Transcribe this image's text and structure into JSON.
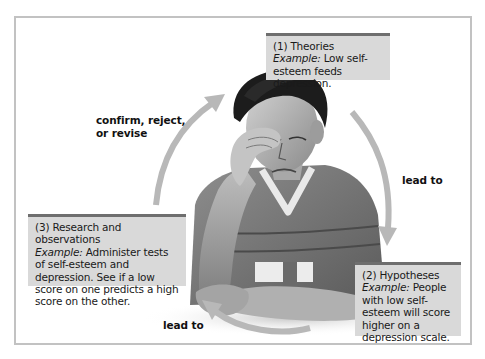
{
  "diagram": {
    "type": "cycle",
    "colors": {
      "box_fill": "#d9d9d9",
      "box_bar": "#6e6e6e",
      "arrow": "#b8b8b8",
      "frame": "#c2c2c2",
      "text": "#1a1a1a"
    },
    "nodes": [
      {
        "id": "theories",
        "title": "(1) Theories",
        "example_label": "Example:",
        "example_text": " Low self-esteem feeds depression."
      },
      {
        "id": "hypotheses",
        "title": "(2) Hypotheses",
        "example_label": "Example:",
        "example_text": " People with low self-esteem will score higher on a depression scale."
      },
      {
        "id": "research",
        "title": "(3) Research and observations",
        "example_label": "Example:",
        "example_text": " Administer tests of self-esteem and depression. See if a low score on one predicts a high score on the other."
      }
    ],
    "edges": [
      {
        "from": "theories",
        "to": "hypotheses",
        "label": "lead to"
      },
      {
        "from": "hypotheses",
        "to": "research",
        "label": "lead to"
      },
      {
        "from": "research",
        "to": "theories",
        "label_line1": "confirm, reject,",
        "label_line2": "or revise"
      }
    ],
    "image": {
      "subject": "depressed-young-man-photo",
      "description": "Young man holding his forehead with one hand, arms folded on a table, wearing a striped T-shirt"
    }
  }
}
